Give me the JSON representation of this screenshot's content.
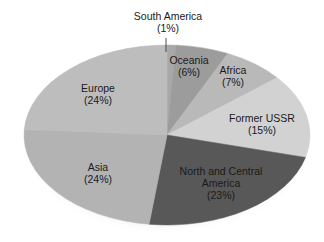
{
  "chart_data": {
    "type": "pie",
    "title": "",
    "style": "3d-tilted-ellipse",
    "legend": "none",
    "slices": [
      {
        "label": "South America",
        "value": 1,
        "color": "#a8a8a8",
        "label_line1": "South America",
        "label_line2": "(1%)"
      },
      {
        "label": "Oceania",
        "value": 6,
        "color": "#9c9c9c",
        "label_line1": "Oceania",
        "label_line2": "(6%)"
      },
      {
        "label": "Africa",
        "value": 7,
        "color": "#b9b9b9",
        "label_line1": "Africa",
        "label_line2": "(7%)"
      },
      {
        "label": "Former USSR",
        "value": 15,
        "color": "#d2d2d2",
        "label_line1": "Former USSR",
        "label_line2": "(15%)"
      },
      {
        "label": "North and Central America",
        "value": 23,
        "color": "#585858",
        "label_line1": "North and Central",
        "label_line2": "America",
        "label_line3": "(23%)"
      },
      {
        "label": "Asia",
        "value": 24,
        "color": "#b3b3b3",
        "label_line1": "Asia",
        "label_line2": "(24%)"
      },
      {
        "label": "Europe",
        "value": 24,
        "color": "#bdbdbd",
        "label_line1": "Europe",
        "label_line2": "(24%)"
      }
    ]
  },
  "labels": {
    "south_america": {
      "line1": "South America",
      "line2": "(1%)"
    },
    "oceania": {
      "line1": "Oceania",
      "line2": "(6%)"
    },
    "africa": {
      "line1": "Africa",
      "line2": "(7%)"
    },
    "former_ussr": {
      "line1": "Former USSR",
      "line2": "(15%)"
    },
    "north_central_america": {
      "line1": "North and Central",
      "line2": "America",
      "line3": "(23%)"
    },
    "asia": {
      "line1": "Asia",
      "line2": "(24%)"
    },
    "europe": {
      "line1": "Europe",
      "line2": "(24%)"
    }
  }
}
